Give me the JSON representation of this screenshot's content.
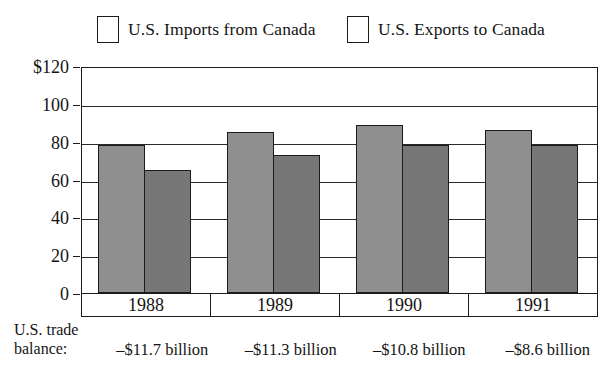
{
  "chart_data": {
    "type": "bar",
    "title": "",
    "subtitle": "",
    "xlabel": "",
    "ylabel": "",
    "categories": [
      "1988",
      "1989",
      "1990",
      "1991"
    ],
    "series": [
      {
        "name": "U.S. Imports from Canada",
        "values": [
          78,
          85,
          89,
          86
        ],
        "color": "#8f8f8f"
      },
      {
        "name": "U.S. Exports to Canada",
        "values": [
          65,
          73,
          78,
          78
        ],
        "color": "#777777"
      }
    ],
    "ylim": [
      0,
      120
    ],
    "yticks": [
      0,
      20,
      40,
      60,
      80,
      100,
      120
    ],
    "ytick_labels": [
      "0",
      "20",
      "40",
      "60",
      "80",
      "100",
      "$120"
    ],
    "grid": true,
    "legend_position": "top",
    "annotations": {
      "row_label_line1": "U.S. trade",
      "row_label_line2": "balance:",
      "values": [
        "–$11.7 billion",
        "–$11.3 billion",
        "–$10.8 billion",
        "–$8.6 billion"
      ]
    }
  },
  "legend": {
    "items": [
      {
        "label": "U.S. Imports from Canada"
      },
      {
        "label": "U.S. Exports to Canada"
      }
    ]
  },
  "axis": {
    "y_labels": [
      "$120",
      "100",
      "80",
      "60",
      "40",
      "20",
      "0"
    ]
  },
  "years": [
    "1988",
    "1989",
    "1990",
    "1991"
  ],
  "balance": {
    "label_line1": "U.S. trade",
    "label_line2": "balance:",
    "values": [
      "–$11.7 billion",
      "–$11.3 billion",
      "–$10.8 billion",
      "–$8.6 billion"
    ]
  },
  "colors": {
    "imports_fill": "#8f8f8f",
    "exports_fill": "#777777",
    "line": "#1b1b1b",
    "background": "#ffffff"
  }
}
